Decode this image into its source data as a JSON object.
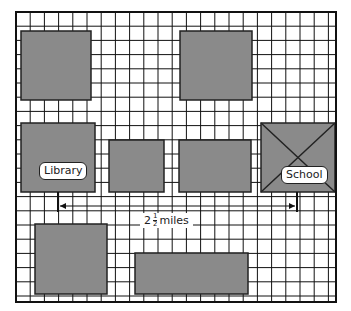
{
  "map": {
    "grid": {
      "left": 16,
      "top": 12,
      "right": 336,
      "bottom": 302,
      "spacing": 14.2,
      "line_color": "#111111",
      "bg": "#ffffff"
    },
    "block_color": "#8a8a8a",
    "blocks": [
      {
        "id": "block-top-left",
        "x": 21,
        "y": 31,
        "w": 70,
        "h": 69
      },
      {
        "id": "block-top-right",
        "x": 180,
        "y": 31,
        "w": 72,
        "h": 69
      },
      {
        "id": "block-library",
        "x": 21,
        "y": 123,
        "w": 74,
        "h": 69,
        "label": "Library"
      },
      {
        "id": "block-mid-1",
        "x": 109,
        "y": 140,
        "w": 55,
        "h": 52
      },
      {
        "id": "block-mid-2",
        "x": 179,
        "y": 140,
        "w": 72,
        "h": 52
      },
      {
        "id": "block-school",
        "x": 261,
        "y": 123,
        "w": 74,
        "h": 69,
        "label": "School",
        "crossed": true
      },
      {
        "id": "block-bottom-left",
        "x": 35,
        "y": 224,
        "w": 72,
        "h": 70
      },
      {
        "id": "block-bottom-wide",
        "x": 135,
        "y": 253,
        "w": 113,
        "h": 41
      }
    ],
    "labels": {
      "library": "Library",
      "school": "School"
    },
    "distance": {
      "whole": "2",
      "numerator": "1",
      "denominator": "2",
      "unit": "miles",
      "from_x": 58,
      "to_x": 297,
      "y": 206
    }
  }
}
